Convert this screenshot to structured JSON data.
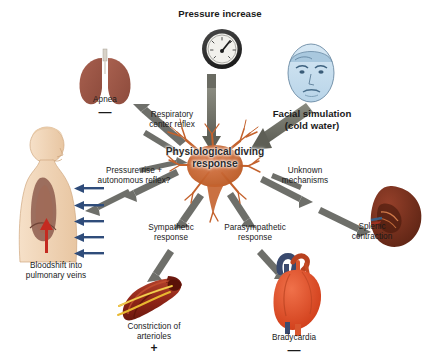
{
  "diagram": {
    "title": "Physiological diving response",
    "center": {
      "label": "Physiological\ndiving\nresponse",
      "icon": "neuron-icon",
      "color": "#c4622d"
    },
    "nodes": [
      {
        "id": "pressure-increase",
        "label": "Pressure increase",
        "icon": "pressure-gauge-icon",
        "bold": true,
        "sign": "",
        "color": "#2f2f2f"
      },
      {
        "id": "apnea",
        "label": "Apnea",
        "icon": "lungs-icon",
        "bold": false,
        "sign": "—",
        "color": "#9e5a4a"
      },
      {
        "id": "facial-simulation",
        "label": "Facial simulation\n(cold water)",
        "icon": "face-icon",
        "bold": true,
        "sign": "",
        "color": "#bcd8ea"
      },
      {
        "id": "bloodshift",
        "label": "Bloodshift into\npulmonary veins",
        "icon": "torso-icon",
        "bold": false,
        "sign": "",
        "color": "#f0d2b4"
      },
      {
        "id": "splenic-contraction",
        "label": "Splenic\ncontraction",
        "icon": "spleen-icon",
        "bold": false,
        "sign": "",
        "color": "#7b2f1c"
      },
      {
        "id": "constriction-of-arterioles",
        "label": "Constriction of\narterioles",
        "icon": "arteriole-icon",
        "bold": false,
        "sign": "+",
        "color": "#9c2b1d"
      },
      {
        "id": "bradycardia",
        "label": "Bradycardia",
        "icon": "heart-icon",
        "bold": false,
        "sign": "—",
        "color": "#e0502a"
      }
    ],
    "connector_labels": [
      {
        "id": "respiratory-center-reflex",
        "label": "Respiratory\ncenter reflex"
      },
      {
        "id": "pressure-rise-autonomous-reflex",
        "label": "Pressure rise +\nautonomous reflex?"
      },
      {
        "id": "unknown-mechanisms",
        "label": "Unknown\nmechanisms"
      },
      {
        "id": "sympathetic-response",
        "label": "Sympathetic\nresponse"
      },
      {
        "id": "parasympathetic-response",
        "label": "Parasympathetic\nresponse"
      }
    ],
    "colors": {
      "arrow_gray": "#7b7c72",
      "thin_arrow_gray": "#6e6f6a",
      "background": "#ffffff",
      "text": "#1a1a1a",
      "neuron": "#c4622d",
      "blue_arrow": "#2f4c7a",
      "red_arrow": "#c42a20"
    }
  }
}
